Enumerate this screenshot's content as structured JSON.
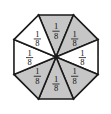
{
  "figure": {
    "name": "octagon-eighths-fraction-model",
    "shape": "regular octagon",
    "total_parts": 8,
    "shaded_parts": 5,
    "unshaded_parts": 3,
    "colors": {
      "shaded_fill": "#c6c6c6",
      "unshaded_fill": "#ffffff",
      "outline": "#1a1a1a",
      "background": "#ffffff"
    },
    "label_text": "1/8",
    "numerator": "1",
    "denominator": "8",
    "wedges": [
      {
        "position": "top",
        "label_numerator": "1",
        "label_denominator": "8",
        "shaded": true,
        "angle_deg": 270
      },
      {
        "position": "upper-right",
        "label_numerator": "1",
        "label_denominator": "8",
        "shaded": true,
        "angle_deg": 315
      },
      {
        "position": "right",
        "label_numerator": "1",
        "label_denominator": "8",
        "shaded": false,
        "angle_deg": 0
      },
      {
        "position": "lower-right",
        "label_numerator": "1",
        "label_denominator": "8",
        "shaded": true,
        "angle_deg": 45
      },
      {
        "position": "bottom",
        "label_numerator": "1",
        "label_denominator": "8",
        "shaded": true,
        "angle_deg": 90
      },
      {
        "position": "lower-left",
        "label_numerator": "1",
        "label_denominator": "8",
        "shaded": true,
        "angle_deg": 135
      },
      {
        "position": "left",
        "label_numerator": "1",
        "label_denominator": "8",
        "shaded": false,
        "angle_deg": 180
      },
      {
        "position": "upper-left",
        "label_numerator": "1",
        "label_denominator": "8",
        "shaded": false,
        "angle_deg": 225
      }
    ]
  }
}
